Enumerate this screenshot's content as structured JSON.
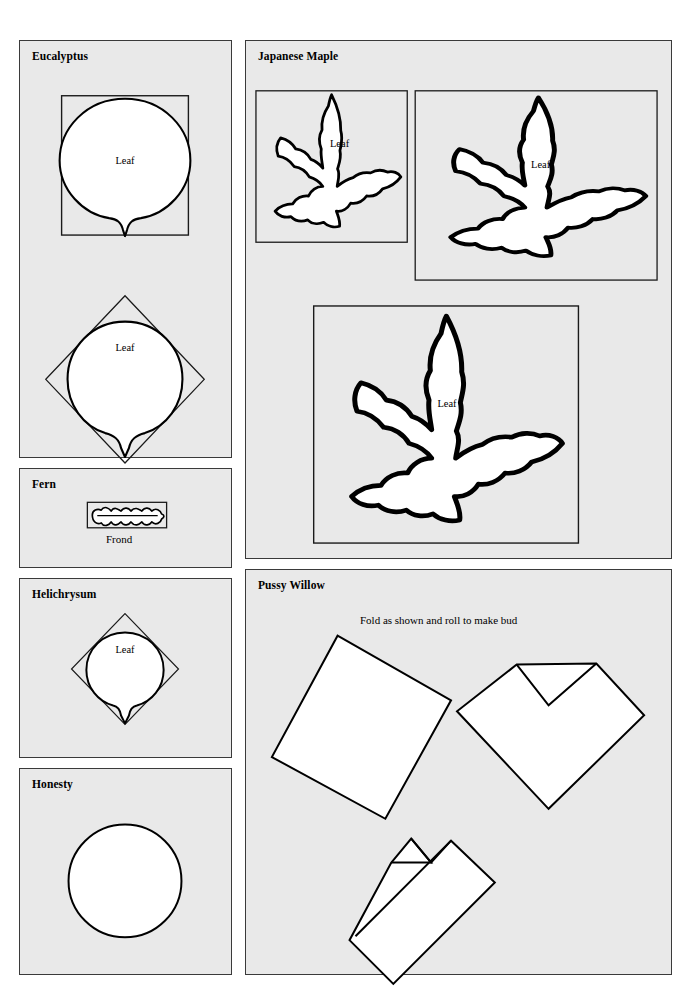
{
  "document": {
    "kind": "craft-template-sheet",
    "background_color": "#ffffff",
    "panel_fill_color": "#e9e9e9",
    "panel_border_color": "#3a3a3a",
    "shape_fill_color": "#ffffff",
    "shape_outline_color": "#000000"
  },
  "panels": {
    "eucalyptus": {
      "title": "Eucalyptus",
      "templates": [
        {
          "name": "eucalyptus-round-leaf",
          "label": "Leaf",
          "frame": "square"
        },
        {
          "name": "eucalyptus-diamond-leaf",
          "label": "Leaf",
          "frame": "diamond"
        }
      ]
    },
    "fern": {
      "title": "Fern",
      "templates": [
        {
          "name": "fern-frond",
          "label": "",
          "frame": "rectangle",
          "caption": "Frond"
        }
      ]
    },
    "helichrysum": {
      "title": "Helichrysum",
      "templates": [
        {
          "name": "helichrysum-leaf",
          "label": "Leaf",
          "frame": "diamond"
        }
      ]
    },
    "honesty": {
      "title": "Honesty",
      "templates": [
        {
          "name": "honesty-disc",
          "label": "",
          "frame": "none"
        }
      ]
    },
    "japanese_maple": {
      "title": "Japanese Maple",
      "templates": [
        {
          "name": "maple-leaf-small",
          "label": "Leaf",
          "frame": "rectangle",
          "size": "small"
        },
        {
          "name": "maple-leaf-medium",
          "label": "Leaf",
          "frame": "rectangle",
          "size": "medium"
        },
        {
          "name": "maple-leaf-large",
          "label": "Leaf",
          "frame": "rectangle",
          "size": "large"
        }
      ]
    },
    "pussy_willow": {
      "title": "Pussy Willow",
      "instruction": "Fold as shown and roll to make bud",
      "templates": [
        {
          "name": "willow-square-flat",
          "label": ""
        },
        {
          "name": "willow-square-folded-top",
          "label": ""
        },
        {
          "name": "willow-square-rolled",
          "label": ""
        }
      ]
    }
  }
}
